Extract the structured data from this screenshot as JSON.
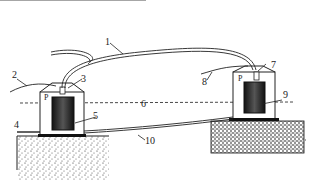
{
  "labels": {
    "l1": "1",
    "l2": "2",
    "l3": "3",
    "l4": "4",
    "l5": "5",
    "l6": "6",
    "l7": "7",
    "l8": "8",
    "l9": "9",
    "l10": "10",
    "p_left": "P",
    "p_right": "P"
  }
}
